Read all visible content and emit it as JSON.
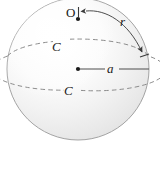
{
  "figure": {
    "type": "geometry-diagram",
    "background_color": "#ffffff",
    "outline_color": "#9a9a9a",
    "dash_color": "#808080",
    "line_color": "#4d4d4d",
    "label_color": "#1a1a1a",
    "labels": {
      "pole_point": "O",
      "arc_radius": "r",
      "center_radius": "a",
      "circle_upper": "C",
      "circle_lower": "C"
    },
    "elements": {
      "sphere_label": "sphere-body",
      "pole_dot_label": "pole-point-dot",
      "center_dot_label": "center-point-dot",
      "arc_label": "arc-r",
      "radius_line_label": "radius-line-a",
      "ellipse_upper_label": "dashed-ellipse-upper",
      "ellipse_lower_label": "dashed-ellipse-lower",
      "tick_label": "pole-tick-mark"
    },
    "geometry": {
      "sphere_center_x": 78,
      "sphere_center_y": 69,
      "sphere_radius_x": 71,
      "sphere_radius_y": 71,
      "pole_x": 78,
      "pole_y": 19,
      "ellipse_upper_ry": 21,
      "ellipse_lower_ry": 21
    }
  }
}
